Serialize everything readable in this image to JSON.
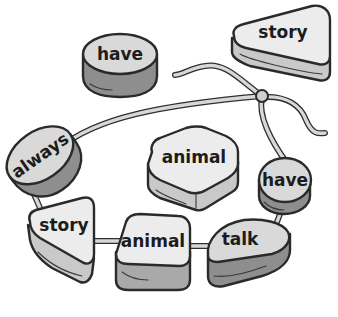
{
  "illustration": {
    "description": "Word beads threaded on a string",
    "loose_beads": [
      {
        "id": "bead-have-loose",
        "word": "have",
        "shape": "round-disc",
        "tone": "dark"
      },
      {
        "id": "bead-story-loose",
        "word": "story",
        "shape": "triangle",
        "tone": "light"
      },
      {
        "id": "bead-animal-loose",
        "word": "animal",
        "shape": "square",
        "tone": "light"
      }
    ],
    "strung_beads": [
      {
        "id": "bead-always",
        "word": "always",
        "shape": "oval",
        "tone": "dark"
      },
      {
        "id": "bead-story",
        "word": "story",
        "shape": "triangle",
        "tone": "light"
      },
      {
        "id": "bead-animal",
        "word": "animal",
        "shape": "square",
        "tone": "light"
      },
      {
        "id": "bead-talk",
        "word": "talk",
        "shape": "half-oval",
        "tone": "dark"
      },
      {
        "id": "bead-have",
        "word": "have",
        "shape": "round-disc",
        "tone": "dark"
      }
    ],
    "colors": {
      "ink": "#2a2a2a",
      "light_top": "#ececec",
      "dark_side": "#8e8e8e",
      "string": "#d8d8d8"
    }
  }
}
